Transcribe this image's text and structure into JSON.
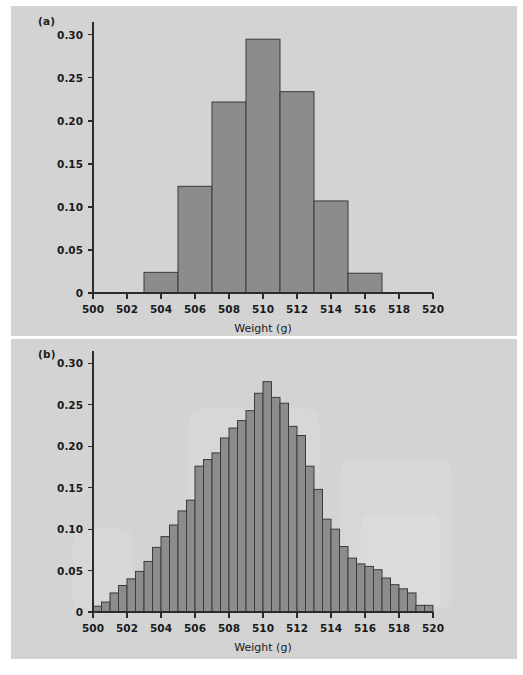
{
  "figure": {
    "background_color": "#ffffff",
    "panel_background_color": "#d2d3d2",
    "bar_fill_color": "#8b8c8b",
    "bar_stroke_color": "#3a3a3a",
    "axis_color": "#2b2b2b"
  },
  "panel_a": {
    "label": "(a)",
    "chart_data": {
      "type": "bar",
      "title": "",
      "subtitle": "",
      "xlabel": "Weight (g)",
      "ylabel": "",
      "xlim": [
        500,
        520
      ],
      "ylim": [
        0,
        0.315
      ],
      "grid": false,
      "legend": "none",
      "bin_width": 2,
      "xticks": [
        500,
        502,
        504,
        506,
        508,
        510,
        512,
        514,
        516,
        518,
        520
      ],
      "xticklabels": [
        "500",
        "502",
        "504",
        "506",
        "508",
        "510",
        "512",
        "514",
        "516",
        "518",
        "520"
      ],
      "yticks": [
        0,
        0.05,
        0.1,
        0.15,
        0.2,
        0.25,
        0.3
      ],
      "yticklabels": [
        "0",
        "0.05",
        "0.10",
        "0.15",
        "0.20",
        "0.25",
        "0.30"
      ],
      "bins": [
        {
          "left": 503,
          "right": 505,
          "value": 0.024
        },
        {
          "left": 505,
          "right": 507,
          "value": 0.124
        },
        {
          "left": 507,
          "right": 509,
          "value": 0.222
        },
        {
          "left": 509,
          "right": 511,
          "value": 0.295
        },
        {
          "left": 511,
          "right": 513,
          "value": 0.234
        },
        {
          "left": 513,
          "right": 515,
          "value": 0.107
        },
        {
          "left": 515,
          "right": 517,
          "value": 0.023
        }
      ],
      "categories": [
        "503-505",
        "505-507",
        "507-509",
        "509-511",
        "511-513",
        "513-515",
        "515-517"
      ],
      "values": [
        0.024,
        0.124,
        0.222,
        0.295,
        0.234,
        0.107,
        0.023
      ]
    }
  },
  "panel_b": {
    "label": "(b)",
    "chart_data": {
      "type": "bar",
      "title": "",
      "subtitle": "",
      "xlabel": "Weight (g)",
      "ylabel": "",
      "xlim": [
        500,
        520
      ],
      "ylim": [
        0,
        0.315
      ],
      "grid": false,
      "legend": "none",
      "bin_width": 0.5,
      "xticks": [
        500,
        502,
        504,
        506,
        508,
        510,
        512,
        514,
        516,
        518,
        520
      ],
      "xticklabels": [
        "500",
        "502",
        "504",
        "506",
        "508",
        "510",
        "512",
        "514",
        "516",
        "518",
        "520"
      ],
      "yticks": [
        0,
        0.05,
        0.1,
        0.15,
        0.2,
        0.25,
        0.3
      ],
      "yticklabels": [
        "0",
        "0.05",
        "0.10",
        "0.15",
        "0.20",
        "0.25",
        "0.30"
      ],
      "bins": [
        {
          "left": 500.0,
          "right": 500.5,
          "value": 0.007
        },
        {
          "left": 500.5,
          "right": 501.0,
          "value": 0.012
        },
        {
          "left": 501.0,
          "right": 501.5,
          "value": 0.023
        },
        {
          "left": 501.5,
          "right": 502.0,
          "value": 0.032
        },
        {
          "left": 502.0,
          "right": 502.5,
          "value": 0.04
        },
        {
          "left": 502.5,
          "right": 503.0,
          "value": 0.049
        },
        {
          "left": 503.0,
          "right": 503.5,
          "value": 0.061
        },
        {
          "left": 503.5,
          "right": 504.0,
          "value": 0.078
        },
        {
          "left": 504.0,
          "right": 504.5,
          "value": 0.091
        },
        {
          "left": 504.5,
          "right": 505.0,
          "value": 0.105
        },
        {
          "left": 505.0,
          "right": 505.5,
          "value": 0.122
        },
        {
          "left": 505.5,
          "right": 506.0,
          "value": 0.135
        },
        {
          "left": 506.0,
          "right": 506.5,
          "value": 0.176
        },
        {
          "left": 506.5,
          "right": 507.0,
          "value": 0.184
        },
        {
          "left": 507.0,
          "right": 507.5,
          "value": 0.192
        },
        {
          "left": 507.5,
          "right": 508.0,
          "value": 0.21
        },
        {
          "left": 508.0,
          "right": 508.5,
          "value": 0.222
        },
        {
          "left": 508.5,
          "right": 509.0,
          "value": 0.231
        },
        {
          "left": 509.0,
          "right": 509.5,
          "value": 0.243
        },
        {
          "left": 509.5,
          "right": 510.0,
          "value": 0.264
        },
        {
          "left": 510.0,
          "right": 510.5,
          "value": 0.278
        },
        {
          "left": 510.5,
          "right": 511.0,
          "value": 0.259
        },
        {
          "left": 511.0,
          "right": 511.5,
          "value": 0.252
        },
        {
          "left": 511.5,
          "right": 512.0,
          "value": 0.224
        },
        {
          "left": 512.0,
          "right": 512.5,
          "value": 0.213
        },
        {
          "left": 512.5,
          "right": 513.0,
          "value": 0.176
        },
        {
          "left": 513.0,
          "right": 513.5,
          "value": 0.148
        },
        {
          "left": 513.5,
          "right": 514.0,
          "value": 0.112
        },
        {
          "left": 514.0,
          "right": 514.5,
          "value": 0.1
        },
        {
          "left": 514.5,
          "right": 515.0,
          "value": 0.079
        },
        {
          "left": 515.0,
          "right": 515.5,
          "value": 0.065
        },
        {
          "left": 515.5,
          "right": 516.0,
          "value": 0.058
        },
        {
          "left": 516.0,
          "right": 516.5,
          "value": 0.055
        },
        {
          "left": 516.5,
          "right": 517.0,
          "value": 0.051
        },
        {
          "left": 517.0,
          "right": 517.5,
          "value": 0.041
        },
        {
          "left": 517.5,
          "right": 518.0,
          "value": 0.033
        },
        {
          "left": 518.0,
          "right": 518.5,
          "value": 0.028
        },
        {
          "left": 518.5,
          "right": 519.0,
          "value": 0.023
        },
        {
          "left": 519.0,
          "right": 519.5,
          "value": 0.008
        },
        {
          "left": 519.5,
          "right": 520.0,
          "value": 0.008
        }
      ],
      "categories": [
        "500.0",
        "500.5",
        "501.0",
        "501.5",
        "502.0",
        "502.5",
        "503.0",
        "503.5",
        "504.0",
        "504.5",
        "505.0",
        "505.5",
        "506.0",
        "506.5",
        "507.0",
        "507.5",
        "508.0",
        "508.5",
        "509.0",
        "509.5",
        "510.0",
        "510.5",
        "511.0",
        "511.5",
        "512.0",
        "512.5",
        "513.0",
        "513.5",
        "514.0",
        "514.5",
        "515.0",
        "515.5",
        "516.0",
        "516.5",
        "517.0",
        "517.5",
        "518.0",
        "518.5",
        "519.0",
        "519.5"
      ],
      "values": [
        0.007,
        0.012,
        0.023,
        0.032,
        0.04,
        0.049,
        0.061,
        0.078,
        0.091,
        0.105,
        0.122,
        0.135,
        0.176,
        0.184,
        0.192,
        0.21,
        0.222,
        0.231,
        0.243,
        0.264,
        0.278,
        0.259,
        0.252,
        0.224,
        0.213,
        0.176,
        0.148,
        0.112,
        0.1,
        0.079,
        0.065,
        0.058,
        0.055,
        0.051,
        0.041,
        0.033,
        0.028,
        0.023,
        0.008,
        0.008
      ]
    }
  }
}
